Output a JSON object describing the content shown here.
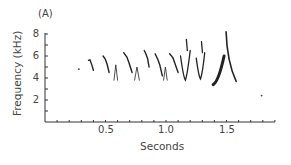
{
  "panel_label": "(A)",
  "chart_data": {
    "type": "scatter",
    "subtype": "spectrogram",
    "title": "",
    "panel_label": "(A)",
    "xlabel": "Seconds",
    "ylabel": "Frequency (kHz)",
    "xlim": [
      0,
      1.9
    ],
    "ylim": [
      0,
      8
    ],
    "x_ticks_labeled": [
      "0.5",
      "1.0",
      "1.5"
    ],
    "y_ticks_labeled": [
      "2",
      "4",
      "6",
      "8"
    ],
    "x_minor_tick_step": 0.1,
    "y_minor_tick_step": 1,
    "grid": false,
    "legend": null,
    "syllables": [
      {
        "id": 1,
        "t": [
          0.28,
          0.285
        ],
        "f": [
          4.8,
          4.5
        ],
        "shape": "dot"
      },
      {
        "id": 2,
        "t": [
          0.36,
          0.4
        ],
        "f": [
          5.6,
          4.7
        ],
        "shape": "downsweep"
      },
      {
        "id": 3,
        "t": [
          0.48,
          0.53
        ],
        "f": [
          6.0,
          4.5
        ],
        "shape": "downsweep"
      },
      {
        "id": 4,
        "t": [
          0.57,
          0.6
        ],
        "f": [
          5.2,
          3.8
        ],
        "shape": "inverted-v"
      },
      {
        "id": 5,
        "t": [
          0.65,
          0.72
        ],
        "f": [
          6.3,
          4.5
        ],
        "shape": "downsweep"
      },
      {
        "id": 6,
        "t": [
          0.74,
          0.78
        ],
        "f": [
          5.0,
          3.8
        ],
        "shape": "inverted-v"
      },
      {
        "id": 7,
        "t": [
          0.82,
          0.86
        ],
        "f": [
          6.5,
          5.0
        ],
        "shape": "downsweep"
      },
      {
        "id": 8,
        "t": [
          0.91,
          0.97
        ],
        "f": [
          6.2,
          4.2
        ],
        "shape": "downsweep"
      },
      {
        "id": 9,
        "t": [
          0.98,
          1.01
        ],
        "f": [
          5.0,
          3.8
        ],
        "shape": "inverted-v"
      },
      {
        "id": 10,
        "t": [
          1.03,
          1.1
        ],
        "f": [
          6.2,
          4.5
        ],
        "shape": "downsweep"
      },
      {
        "id": 11,
        "t": [
          1.12,
          1.2
        ],
        "f": [
          7.5,
          3.8
        ],
        "shape": "v"
      },
      {
        "id": 12,
        "t": [
          1.25,
          1.32
        ],
        "f": [
          7.3,
          3.9
        ],
        "shape": "v"
      },
      {
        "id": 13,
        "t": [
          1.39,
          1.48
        ],
        "f": [
          3.4,
          6.0
        ],
        "shape": "upsweep-thick"
      },
      {
        "id": 14,
        "t": [
          1.48,
          1.58
        ],
        "f": [
          8.2,
          3.7
        ],
        "shape": "spike"
      },
      {
        "id": 15,
        "t": [
          1.79,
          1.8
        ],
        "f": [
          2.4,
          2.2
        ],
        "shape": "dot"
      }
    ]
  },
  "axes": {
    "y_tick_labels": [
      "8",
      "6",
      "4",
      "2"
    ],
    "x_tick_labels": [
      "0.5",
      "1.0",
      "1.5"
    ],
    "xlabel": "Seconds",
    "ylabel": "Frequency (kHz)"
  }
}
